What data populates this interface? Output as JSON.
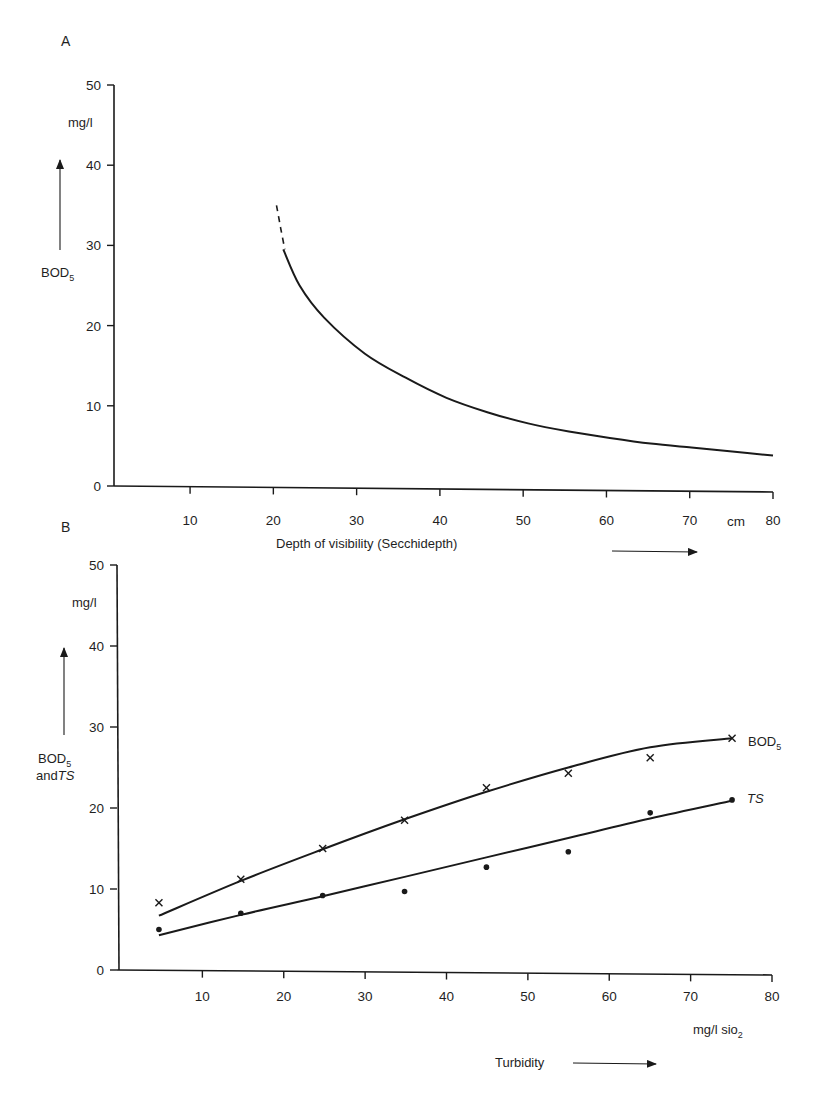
{
  "figure": {
    "panel_a_label": "A",
    "panel_b_label": "B"
  },
  "chart_data": [
    {
      "type": "line",
      "panel": "A",
      "title": "",
      "xlabel": "Depth of visibility (Secchidepth)",
      "x_unit": "cm",
      "ylabel": "BOD5",
      "y_unit": "mg/l",
      "xlim": [
        0,
        80
      ],
      "ylim": [
        0,
        50
      ],
      "x_ticks": [
        10,
        20,
        30,
        40,
        50,
        60,
        70,
        80
      ],
      "x_tick_labels": [
        "10",
        "20",
        "30",
        "40",
        "50",
        "60",
        "70 cm",
        "80"
      ],
      "y_ticks": [
        0,
        10,
        20,
        30,
        40,
        50
      ],
      "grid": false,
      "series": [
        {
          "name": "BOD5 (extrapolated, dashed)",
          "style": "dashed",
          "x": [
            19,
            19.5,
            20
          ],
          "y": [
            35,
            32.2,
            29.5
          ]
        },
        {
          "name": "BOD5",
          "style": "solid",
          "x": [
            20,
            22,
            25,
            30,
            35,
            40,
            45,
            50,
            55,
            60,
            65,
            70,
            75,
            80
          ],
          "y": [
            29.5,
            25,
            21,
            16.5,
            13.5,
            11,
            9.2,
            7.8,
            6.8,
            6,
            5.3,
            4.8,
            4.3,
            3.8
          ]
        }
      ]
    },
    {
      "type": "scatter",
      "panel": "B",
      "title": "",
      "xlabel": "Turbidity",
      "x_unit": "mg/l sio2",
      "ylabel": "BOD5 and TS",
      "y_unit": "mg/l",
      "xlim": [
        0,
        80
      ],
      "ylim": [
        0,
        50
      ],
      "x_ticks": [
        10,
        20,
        30,
        40,
        50,
        60,
        70,
        80
      ],
      "y_ticks": [
        0,
        10,
        20,
        30,
        40,
        50
      ],
      "grid": false,
      "legend": "inline labels at right end of curves",
      "series": [
        {
          "name": "BOD5",
          "marker": "x",
          "x": [
            5,
            15,
            25,
            35,
            45,
            55,
            65,
            75
          ],
          "y": [
            8.3,
            11.2,
            15,
            18.5,
            22.5,
            24.3,
            26.2,
            28.6
          ],
          "fit_x": [
            5,
            15,
            25,
            35,
            45,
            55,
            65,
            75
          ],
          "fit_y": [
            6.7,
            11,
            14.9,
            18.6,
            22,
            25,
            27.5,
            28.6
          ]
        },
        {
          "name": "TS",
          "marker": "dot",
          "x": [
            5,
            15,
            25,
            35,
            45,
            55,
            65,
            75
          ],
          "y": [
            5,
            7,
            9.2,
            9.7,
            12.7,
            14.6,
            19.4,
            21
          ],
          "fit_x": [
            5,
            15,
            25,
            35,
            45,
            55,
            65,
            75
          ],
          "fit_y": [
            4.3,
            6.8,
            9.1,
            11.5,
            13.9,
            16.3,
            18.7,
            20.9
          ]
        }
      ]
    }
  ],
  "panel_a": {
    "y_unit": "mg/l",
    "y_title_main": "BOD",
    "y_title_sub": "5",
    "x_title": "Depth of visibility (Secchidepth)",
    "x_unit": "cm",
    "y_ticks": [
      "0",
      "10",
      "20",
      "30",
      "40",
      "50"
    ],
    "x_ticks": [
      "10",
      "20",
      "30",
      "40",
      "50",
      "60",
      "70",
      "80"
    ]
  },
  "panel_b": {
    "y_unit": "mg/l",
    "y_title_line1_main": "BOD",
    "y_title_line1_sub": "5",
    "y_title_line2_prefix": "and",
    "y_title_line2_italic": "TS",
    "x_title": "Turbidity",
    "x_unit_main": "mg/l sio",
    "x_unit_sub": "2",
    "y_ticks": [
      "0",
      "10",
      "20",
      "30",
      "40",
      "50"
    ],
    "x_ticks": [
      "10",
      "20",
      "30",
      "40",
      "50",
      "60",
      "70",
      "80"
    ],
    "series_label_bod_main": "BOD",
    "series_label_bod_sub": "5",
    "series_label_ts": "TS"
  }
}
